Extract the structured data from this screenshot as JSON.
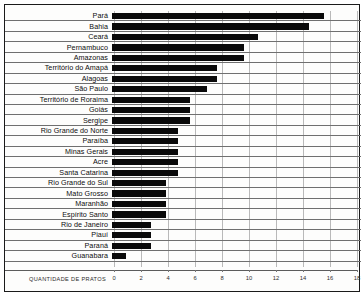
{
  "chart_data": {
    "type": "bar",
    "orientation": "horizontal",
    "title": "",
    "subtitle": "",
    "xlabel": "QUANTIDADE DE PRATOS",
    "ylabel": "",
    "xlim": [
      0,
      18
    ],
    "grid": true,
    "legend": false,
    "legend_position": "none",
    "xticks": [
      "0",
      "2",
      "4",
      "6",
      "8",
      "10",
      "12",
      "14",
      "16",
      "18"
    ],
    "xtick_values": [
      0,
      2,
      4,
      6,
      8,
      10,
      12,
      14,
      16,
      18
    ],
    "categories": [
      "Pará",
      "Bahia",
      "Ceará",
      "Pernambuco",
      "Amazonas",
      "Território do Amapá",
      "Alagoas",
      "São Paulo",
      "Território de Roraima",
      "Goiás",
      "Sergipe",
      "Rio Grande do Norte",
      "Paraíba",
      "Minas Gerais",
      "Acre",
      "Santa Catarina",
      "Rio Grande do Sul",
      "Mato Grosso",
      "Maranhão",
      "Espírito Santo",
      "Rio de Janeiro",
      "Piauí",
      "Paraná",
      "Guanabara"
    ],
    "values": [
      15.7,
      14.6,
      10.8,
      9.8,
      9.8,
      7.8,
      7.8,
      7.0,
      5.8,
      5.8,
      5.8,
      4.9,
      4.9,
      4.9,
      4.9,
      4.9,
      4.0,
      4.0,
      4.0,
      4.0,
      2.9,
      2.9,
      2.9,
      1.0
    ],
    "bar_color": "#0a0a0a",
    "background_color": "#fdfdfc",
    "grid_color": "#b9b9b9"
  },
  "axis": {
    "title": "QUANTIDADE DE PRATOS"
  }
}
